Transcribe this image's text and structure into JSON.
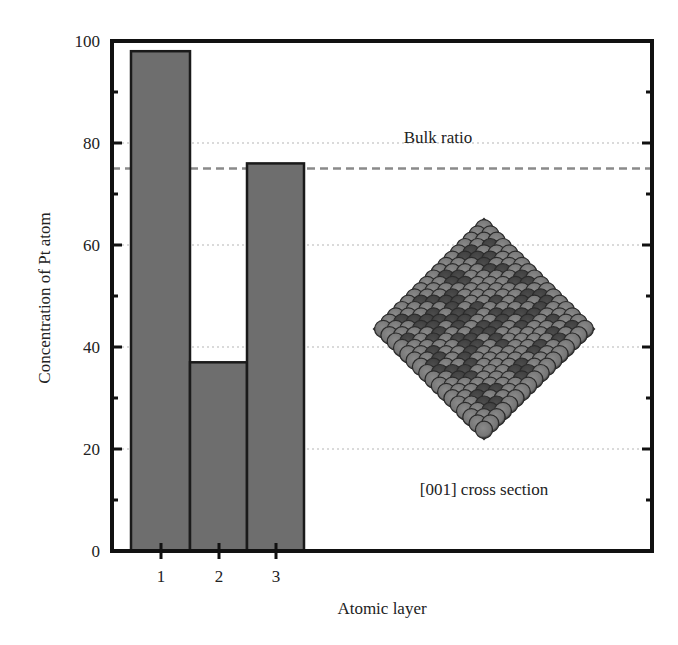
{
  "chart_data": {
    "type": "bar",
    "title": "",
    "xlabel": "Atomic layer",
    "ylabel": "Concentration of Pt atom",
    "categories": [
      "1",
      "2",
      "3"
    ],
    "values": [
      98,
      37,
      76
    ],
    "ylim": [
      0,
      100
    ],
    "yticks": [
      0,
      20,
      40,
      60,
      80,
      100
    ],
    "yticks_labels": [
      "0",
      "20",
      "40",
      "60",
      "80",
      "100"
    ],
    "grid": "dotted horizontal at 20, 40, 60, 80 (partially)",
    "reference_lines": [
      {
        "name": "Bulk ratio",
        "y": 75,
        "style": "dashed"
      }
    ],
    "annotations": [
      {
        "text": "Bulk ratio",
        "position": "above dashed line"
      },
      {
        "text": "[001] cross section",
        "position": "below inset nanoparticle image"
      }
    ],
    "inset": {
      "description": "diamond-shaped atomic nanoparticle cross-section image",
      "caption": "[001] cross section"
    },
    "legend": "none",
    "bar_color": "#6e6e6e",
    "bar_edge_color": "#1a1a1a"
  },
  "labels": {
    "xlabel": "Atomic layer",
    "ylabel": "Concentration of Pt atom",
    "bulk_ratio": "Bulk ratio",
    "cross_section": "[001] cross section",
    "yticks": [
      "0",
      "20",
      "40",
      "60",
      "80",
      "100"
    ],
    "xticks": [
      "1",
      "2",
      "3"
    ]
  }
}
